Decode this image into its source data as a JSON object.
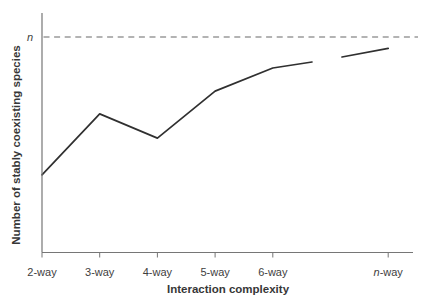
{
  "figure": {
    "background": "#ffffff"
  },
  "chart_data": {
    "type": "line",
    "title": "",
    "xlabel": "Interaction complexity",
    "ylabel": "Number of stably coexisting species",
    "categories": [
      "2-way",
      "3-way",
      "4-way",
      "5-way",
      "6-way",
      "n-way"
    ],
    "category_x_positions": [
      2,
      3,
      4,
      5,
      6,
      8
    ],
    "x_axis_range": [
      2,
      8.43
    ],
    "y_axis_range": [
      0,
      1.11
    ],
    "value_scale": "fraction_of_n",
    "grid": "off",
    "legend": "none",
    "reference_line": {
      "label": "n",
      "value": 1.0,
      "style": "dashed"
    },
    "series": [
      {
        "name": "stably coexisting species curve",
        "segments": [
          {
            "x": [
              2,
              3,
              4,
              5,
              6,
              6.68
            ],
            "values": [
              0.36,
              0.643,
              0.531,
              0.749,
              0.856,
              0.884
            ]
          },
          {
            "x": [
              7.2,
              8.0
            ],
            "values": [
              0.907,
              0.947
            ]
          }
        ],
        "gap_between_segments": "break between 6-way and n-way indicating continuation"
      }
    ],
    "colors": {
      "curve": "#303030",
      "axis": "#767676",
      "reference_dash": "#9a9a9a",
      "text": "#3e3e3e"
    }
  }
}
